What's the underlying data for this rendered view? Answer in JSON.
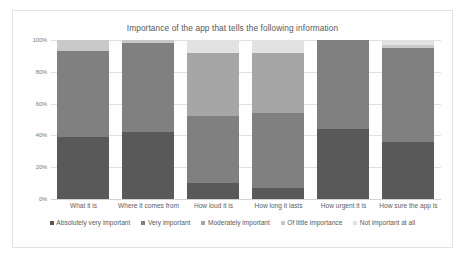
{
  "chart_data": {
    "type": "bar",
    "stacked": true,
    "stack_mode": "percent",
    "title": "Importance of the app that tells the following information",
    "xlabel": "",
    "ylabel": "",
    "ylim": [
      0,
      100
    ],
    "ytick_labels": [
      "0%",
      "20%",
      "40%",
      "60%",
      "80%",
      "100%"
    ],
    "ytick_values": [
      0,
      20,
      40,
      60,
      80,
      100
    ],
    "grid": true,
    "legend_position": "bottom",
    "categories": [
      "What it is",
      "Where it comes from",
      "How loud it is",
      "How long it lasts",
      "How urgent it is",
      "How sure the app is"
    ],
    "series": [
      {
        "name": "Absolutely very important",
        "color": "#595959",
        "values": [
          39,
          42,
          10,
          7,
          44,
          36
        ]
      },
      {
        "name": "Very important",
        "color": "#808080",
        "values": [
          54,
          56,
          42,
          47,
          56,
          59
        ]
      },
      {
        "name": "Moderately important",
        "color": "#a6a6a6",
        "values": [
          0,
          0,
          40,
          38,
          0,
          0
        ]
      },
      {
        "name": "Of little importance",
        "color": "#c9c9c9",
        "values": [
          7,
          2,
          0,
          0,
          0,
          2
        ]
      },
      {
        "name": "Not important at all",
        "color": "#e2e2e2",
        "values": [
          0,
          0,
          8,
          8,
          0,
          3
        ]
      }
    ]
  },
  "colors": {
    "plot_background": "#fefefe",
    "card_border": "#e3e3e3",
    "gridline": "#e0e0e0",
    "axis": "#d2d2d2",
    "title_text": "#585858",
    "tick_text": "#757575",
    "legend_text": "#5d5d5d"
  }
}
